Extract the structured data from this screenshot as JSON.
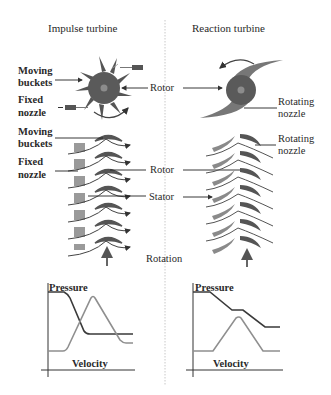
{
  "titles": {
    "left": "Impulse turbine",
    "right": "Reaction turbine"
  },
  "center_labels": {
    "rotor_top": "Rotor",
    "rotor_mid": "Rotor",
    "stator": "Stator",
    "rotation": "Rotation"
  },
  "left_labels": {
    "moving_buckets_1_line1": "Moving",
    "moving_buckets_1_line2": "buckets",
    "fixed_nozzle_1_line1": "Fixed",
    "fixed_nozzle_1_line2": "nozzle",
    "moving_buckets_2_line1": "Moving",
    "moving_buckets_2_line2": "buckets",
    "fixed_nozzle_2_line1": "Fixed",
    "fixed_nozzle_2_line2": "nozzle"
  },
  "right_labels": {
    "rotating_nozzle_1_line1": "Rotating",
    "rotating_nozzle_1_line2": "nozzle",
    "rotating_nozzle_2_line1": "Rotating",
    "rotating_nozzle_2_line2": "nozzle"
  },
  "graphs": {
    "left": {
      "pressure_label": "Pressure",
      "velocity_label": "Velocity"
    },
    "right": {
      "pressure_label": "Pressure",
      "velocity_label": "Velocity"
    }
  },
  "colors": {
    "rotor_fill": "#5a5a5a",
    "rotor_hub": "#8a8a8a",
    "stator_fill": "#9a9a9a",
    "pressure_line": "#3a3a3a",
    "velocity_line": "#8f8f8f",
    "divider": "#c8c8c8"
  }
}
